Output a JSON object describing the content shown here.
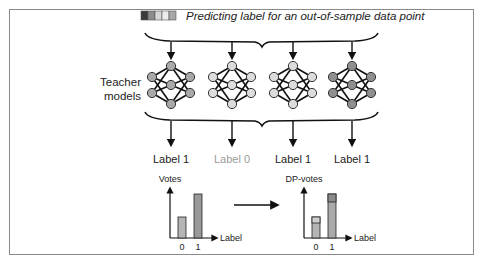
{
  "header": {
    "title": "Predicting label for an out-of-sample data point",
    "data_point_swatches": [
      "#3a3a3a",
      "#8c8c8c",
      "#d6d6d6",
      "#e8e8e8",
      "#a8a8a8"
    ]
  },
  "teacher_label": [
    "Teacher",
    "models"
  ],
  "models": [
    {
      "node_color": "#a9a9a9",
      "label": "Label 1",
      "label_color": "#222222"
    },
    {
      "node_color": "#dcdcdc",
      "label": "Label 0",
      "label_color": "#9a9a9a"
    },
    {
      "node_color": "#dcdcdc",
      "label": "Label 1",
      "label_color": "#222222"
    },
    {
      "node_color": "#8f8f8f",
      "label": "Label 1",
      "label_color": "#222222"
    }
  ],
  "charts": {
    "votes": {
      "ylabel": "Votes",
      "xlabel": "Label",
      "ticks": [
        "0",
        "1"
      ]
    },
    "dp_votes": {
      "ylabel": "DP-votes",
      "xlabel": "Label",
      "ticks": [
        "0",
        "1"
      ]
    }
  },
  "chart_data": [
    {
      "type": "bar",
      "title": "Votes",
      "xlabel": "Label",
      "ylabel": "Votes",
      "categories": [
        "0",
        "1"
      ],
      "values": [
        1,
        3
      ]
    },
    {
      "type": "bar",
      "title": "DP-votes",
      "xlabel": "Label",
      "ylabel": "DP-votes",
      "categories": [
        "0",
        "1"
      ],
      "series": [
        {
          "name": "votes",
          "values": [
            1,
            3
          ]
        },
        {
          "name": "noise",
          "values": [
            0.4,
            0.6
          ]
        }
      ]
    }
  ]
}
